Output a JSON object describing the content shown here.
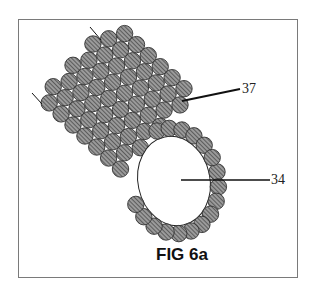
{
  "figure": {
    "caption": "FIG 6a",
    "reference_labels": [
      {
        "id": "37",
        "text": "37",
        "target": "outer strand layer of particles"
      },
      {
        "id": "34",
        "text": "34",
        "target": "hollow lumen / inner opening"
      }
    ],
    "element_style": {
      "particle_fill": "#9a9a9a",
      "particle_hatch": "#3a3a3a",
      "particle_outline": "#333333",
      "line_color": "#111111",
      "background": "#ffffff",
      "frame_color": "#7a7a7a"
    }
  }
}
